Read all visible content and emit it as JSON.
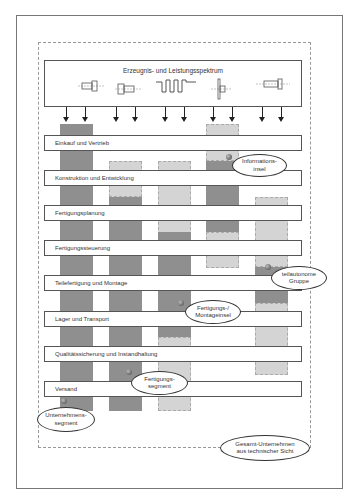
{
  "header": {
    "title": "Erzeugnis- und Leistungsspektrum"
  },
  "products": [
    {
      "name": "part-1-icon"
    },
    {
      "name": "part-2-icon"
    },
    {
      "name": "crankshaft-icon"
    },
    {
      "name": "shaft-flange-icon"
    },
    {
      "name": "bolt-icon"
    }
  ],
  "rows": [
    {
      "label": "Einkauf und Vertrieb"
    },
    {
      "label": "Konstruktion und Entwicklung"
    },
    {
      "label": "Fertigungsplanung"
    },
    {
      "label": "Fertigungssteuerung"
    },
    {
      "label": "Teilefertigung und Montage"
    },
    {
      "label": "Lager und Transport"
    },
    {
      "label": "Qualitätssicherung und Instandhaltung"
    },
    {
      "label": "Versand"
    }
  ],
  "callouts": {
    "informationsinsel": "Informations-\ninsel",
    "teilautonome_gruppe": "teilautonome\nGruppe",
    "fertigungs_montageinsel": "Fertigungs-/\nMontageinsel",
    "fertigungssegment": "Fertigungs-\nsegment",
    "unternehmenssegment": "Unternehmens-\nsegment",
    "gesamt_unternehmen": "Gesamt-Unternehmen\naus technischer Sicht"
  },
  "colors": {
    "dark_bar": "#8f8f8f",
    "light_bar": "#d4d4d4",
    "border": "#555555"
  }
}
